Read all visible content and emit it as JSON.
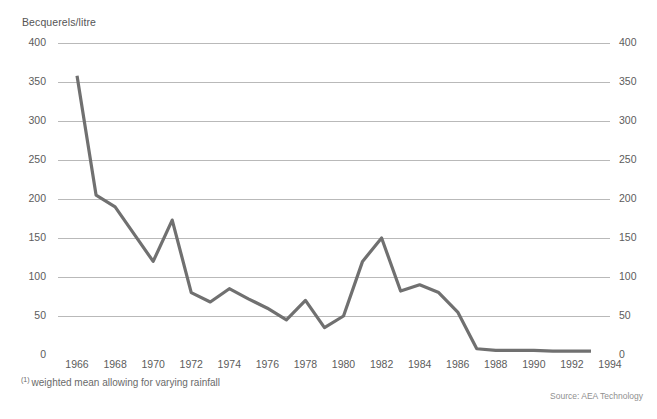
{
  "chart_data": {
    "type": "line",
    "title": "Becquerels/litre",
    "xlabel": "",
    "ylabel": "Becquerels/litre",
    "ylim": [
      0,
      400
    ],
    "xlim": [
      1965,
      1994
    ],
    "grid": true,
    "legend_position": "none",
    "y_ticks": [
      0,
      50,
      100,
      150,
      200,
      250,
      300,
      350,
      400
    ],
    "y_tick_labels": [
      "0",
      "50",
      "100",
      "150",
      "200",
      "250",
      "300",
      "350",
      "400"
    ],
    "y_axis_duplicated_right": true,
    "x_ticks": [
      1966,
      1968,
      1970,
      1972,
      1974,
      1976,
      1978,
      1980,
      1982,
      1984,
      1986,
      1988,
      1990,
      1992,
      1994
    ],
    "x_tick_labels": [
      "1966",
      "1968",
      "1970",
      "1972",
      "1974",
      "1976",
      "1978",
      "1980",
      "1982",
      "1984",
      "1986",
      "1988",
      "1990",
      "1992",
      "1994"
    ],
    "x": [
      1966,
      1967,
      1968,
      1969,
      1970,
      1971,
      1972,
      1973,
      1974,
      1975,
      1976,
      1977,
      1978,
      1979,
      1980,
      1981,
      1982,
      1983,
      1984,
      1985,
      1986,
      1987,
      1988,
      1989,
      1990,
      1991,
      1992,
      1993
    ],
    "values": [
      358,
      205,
      190,
      155,
      120,
      173,
      80,
      68,
      85,
      72,
      60,
      45,
      70,
      35,
      50,
      120,
      150,
      82,
      90,
      80,
      55,
      8,
      6,
      6,
      6,
      5,
      5,
      5
    ],
    "series": [
      {
        "name": "Becquerels/litre",
        "color": "#707070",
        "values": [
          358,
          205,
          190,
          155,
          120,
          173,
          80,
          68,
          85,
          72,
          60,
          45,
          70,
          35,
          50,
          120,
          150,
          82,
          90,
          80,
          55,
          8,
          6,
          6,
          6,
          5,
          5,
          5
        ]
      }
    ],
    "annotations": {
      "footnote_marker": "(1)",
      "footnote_text": "weighted mean allowing for varying rainfall",
      "source": "Source: AEA Technology"
    },
    "colors": {
      "line": "#707070",
      "grid": "#b9b9b9",
      "tick": "#8a8a8a",
      "text": "#5c5c5c",
      "background": "#ffffff"
    }
  },
  "footnote": {
    "marker": "(1)",
    "text": "weighted mean allowing for varying rainfall"
  },
  "source": {
    "text": "Source: AEA Technology"
  }
}
